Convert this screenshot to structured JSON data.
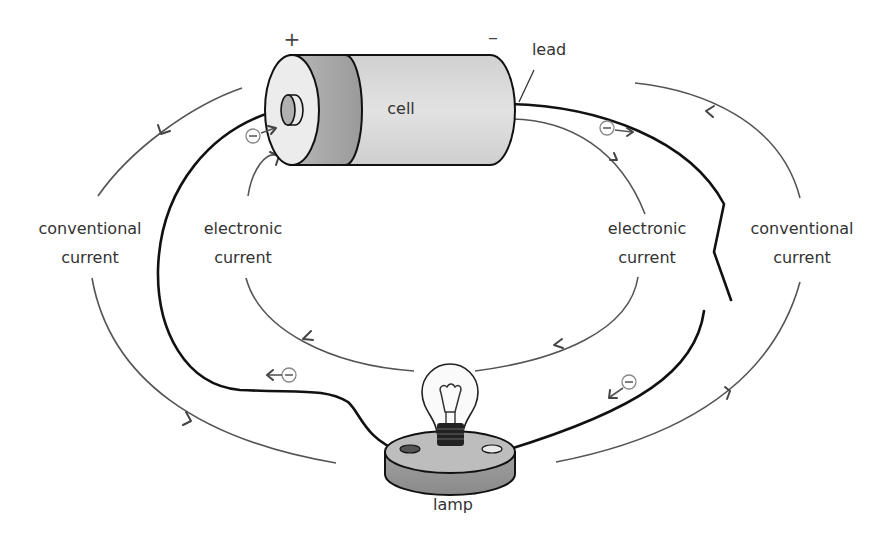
{
  "diagram": {
    "labels": {
      "positive_terminal": "+",
      "negative_terminal": "–",
      "cell": "cell",
      "lead": "lead",
      "lamp": "lamp",
      "conventional_left_line1": "conventional",
      "conventional_left_line2": "current",
      "electronic_left_line1": "electronic",
      "electronic_left_line2": "current",
      "electronic_right_line1": "electronic",
      "electronic_right_line2": "current",
      "conventional_right_line1": "conventional",
      "conventional_right_line2": "current"
    },
    "flows": [
      {
        "name": "conventional-current-outer",
        "direction": "clockwise",
        "note": "flows from + terminal through circuit to – terminal"
      },
      {
        "name": "electronic-current-inner",
        "direction": "counter-clockwise",
        "note": "electrons flow from – terminal through circuit to + terminal"
      }
    ],
    "electron_markers": [
      "⊖",
      "⊖",
      "⊖",
      "⊖"
    ],
    "colors": {
      "background": "#ffffff",
      "wire": "#111111",
      "flow_line": "#555555",
      "cell_body": "#d9d9d9",
      "cell_band": "#a8a8a8",
      "cell_cap": "#ececec",
      "lamp_base_top": "#bdbdbd",
      "lamp_base_side": "#9a9a9a"
    }
  }
}
